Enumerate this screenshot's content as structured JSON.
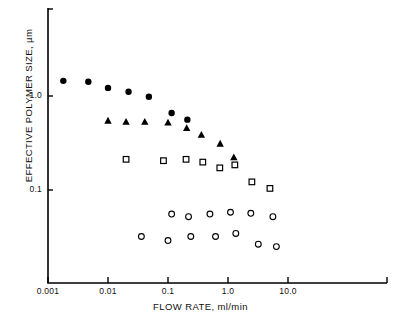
{
  "chart_data": {
    "type": "scatter",
    "title": "",
    "xlabel": "FLOW RATE, ml/min",
    "ylabel": "EFFECTIVE POLYMER SIZE, µm",
    "xscale": "log",
    "yscale": "log",
    "xlim": [
      0.001,
      70
    ],
    "ylim": [
      0.018,
      2.6
    ],
    "grid": false,
    "legend": "none",
    "xticks": [
      {
        "value": 0.001,
        "label": "0.001"
      },
      {
        "value": 0.01,
        "label": "0.01"
      },
      {
        "value": 0.1,
        "label": "0.1"
      },
      {
        "value": 1.0,
        "label": "1.0"
      },
      {
        "value": 10.0,
        "label": "10.0"
      }
    ],
    "yticks": [
      {
        "value": 1.0,
        "label": "1.0"
      },
      {
        "value": 0.1,
        "label": "0.1"
      }
    ],
    "series": [
      {
        "name": "filled-circle",
        "marker": "filled-circle",
        "color": "#000000",
        "points": [
          {
            "x": 0.0018,
            "y": 1.45
          },
          {
            "x": 0.0047,
            "y": 1.42
          },
          {
            "x": 0.01,
            "y": 1.22
          },
          {
            "x": 0.022,
            "y": 1.11
          },
          {
            "x": 0.048,
            "y": 0.98
          },
          {
            "x": 0.115,
            "y": 0.66
          },
          {
            "x": 0.21,
            "y": 0.56
          }
        ]
      },
      {
        "name": "filled-triangle",
        "marker": "filled-triangle",
        "color": "#000000",
        "points": [
          {
            "x": 0.01,
            "y": 0.545
          },
          {
            "x": 0.02,
            "y": 0.53
          },
          {
            "x": 0.041,
            "y": 0.53
          },
          {
            "x": 0.1,
            "y": 0.52
          },
          {
            "x": 0.205,
            "y": 0.455
          },
          {
            "x": 0.36,
            "y": 0.385
          },
          {
            "x": 0.74,
            "y": 0.31
          },
          {
            "x": 1.25,
            "y": 0.222
          }
        ]
      },
      {
        "name": "open-square",
        "marker": "open-square",
        "color": "#000000",
        "points": [
          {
            "x": 0.02,
            "y": 0.212
          },
          {
            "x": 0.084,
            "y": 0.205
          },
          {
            "x": 0.2,
            "y": 0.212
          },
          {
            "x": 0.38,
            "y": 0.198
          },
          {
            "x": 0.73,
            "y": 0.172
          },
          {
            "x": 1.3,
            "y": 0.185
          },
          {
            "x": 2.5,
            "y": 0.122
          },
          {
            "x": 5.0,
            "y": 0.104
          }
        ]
      },
      {
        "name": "open-circle-upper",
        "marker": "open-circle",
        "color": "#000000",
        "points": [
          {
            "x": 0.115,
            "y": 0.0555
          },
          {
            "x": 0.22,
            "y": 0.052
          },
          {
            "x": 0.5,
            "y": 0.0555
          },
          {
            "x": 1.1,
            "y": 0.058
          },
          {
            "x": 2.4,
            "y": 0.0565
          },
          {
            "x": 5.6,
            "y": 0.052
          }
        ]
      },
      {
        "name": "open-circle-lower",
        "marker": "open-circle",
        "color": "#000000",
        "points": [
          {
            "x": 0.036,
            "y": 0.032
          },
          {
            "x": 0.1,
            "y": 0.029
          },
          {
            "x": 0.24,
            "y": 0.032
          },
          {
            "x": 0.62,
            "y": 0.032
          },
          {
            "x": 1.35,
            "y": 0.0345
          },
          {
            "x": 3.2,
            "y": 0.0265
          },
          {
            "x": 6.4,
            "y": 0.025
          }
        ]
      }
    ]
  }
}
